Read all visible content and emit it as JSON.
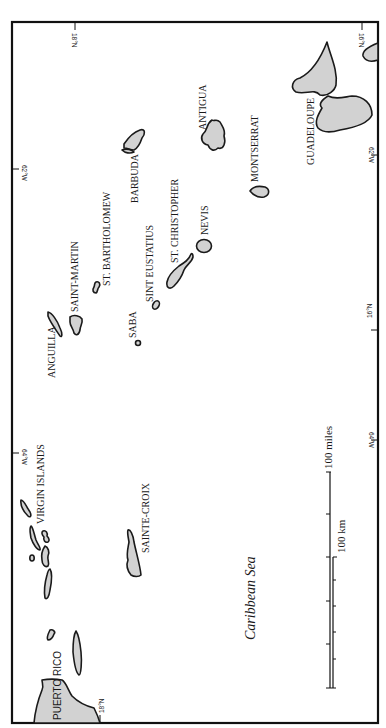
{
  "map": {
    "sea_label": "Caribbean Sea",
    "colors": {
      "land": "#d2d2d2",
      "outline": "#1a1a1a",
      "background": "#ffffff"
    },
    "places": {
      "puerto_rico": "PUERTO RICO",
      "virgin_islands": "VIRGIN ISLANDS",
      "sainte_croix": "SAINTE-CROIX",
      "anguilla": "ANGUILLA",
      "saint_martin": "SAINT-MARTIN",
      "st_bartholomew": "ST. BARTHOLOMEW",
      "saba": "SABA",
      "sint_eustatius": "SINT EUSTATIUS",
      "st_christopher": "ST. CHRISTOPHER",
      "nevis": "NEVIS",
      "barbuda": "BARBUDA",
      "antigua": "ANTIGUA",
      "montserrat": "MONTSERRAT",
      "guadeloupe": "GUADELOUPE"
    },
    "coordinates": {
      "top_left_lat": "18°N",
      "top_right_lat": "16°N",
      "left_lon_62": "62°W",
      "left_lon_64": "64°W",
      "right_lon_62": "62°W",
      "right_lon_64": "64°W",
      "bottom_right_lat": "16°N",
      "bottom_left_lat": "18°N"
    },
    "scale": {
      "miles_label": "100 miles",
      "km_label": "100 km"
    }
  }
}
